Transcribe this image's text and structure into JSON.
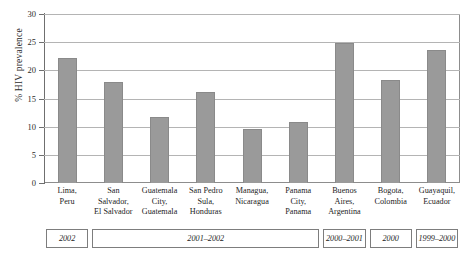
{
  "chart_data": {
    "type": "bar",
    "title": "",
    "xlabel": "",
    "ylabel": "% HIV prevalence",
    "ylim": [
      0,
      30
    ],
    "yticks": [
      0,
      5,
      10,
      15,
      20,
      25,
      30
    ],
    "ytick_labels": [
      "0",
      "5",
      "10",
      "15",
      "20",
      "25",
      "30"
    ],
    "grid": true,
    "legend": "none",
    "bar_color": "#9a9a9a",
    "categories": [
      "Lima, Peru",
      "San Salvador, El Salvador",
      "Guatemala City, Guatemala",
      "San Pedro Sula, Honduras",
      "Managua, Nicaragua",
      "Panama City, Panama",
      "Buenos Aires, Argentina",
      "Bogota, Colombia",
      "Guayaquil, Ecuador"
    ],
    "category_lines": [
      [
        "Lima,",
        "Peru"
      ],
      [
        "San",
        "Salvador,",
        "El Salvador"
      ],
      [
        "Guatemala",
        "City,",
        "Guatemala"
      ],
      [
        "San Pedro",
        "Sula,",
        "Honduras"
      ],
      [
        "Managua,",
        "Nicaragua"
      ],
      [
        "Panama",
        "City,",
        "Panama"
      ],
      [
        "Buenos",
        "Aires,",
        "Argentina"
      ],
      [
        "Bogota,",
        "Colombia"
      ],
      [
        "Guayaquil,",
        "Ecuador"
      ]
    ],
    "values": [
      22.2,
      17.9,
      11.7,
      16.2,
      9.5,
      10.8,
      24.9,
      18.3,
      23.7
    ],
    "year_bands": [
      {
        "label": "2002",
        "start_index": 0,
        "end_index": 0
      },
      {
        "label": "2001–2002",
        "start_index": 1,
        "end_index": 5
      },
      {
        "label": "2000–2001",
        "start_index": 6,
        "end_index": 6
      },
      {
        "label": "2000",
        "start_index": 7,
        "end_index": 7
      },
      {
        "label": "1999–2000",
        "start_index": 8,
        "end_index": 8
      }
    ]
  }
}
